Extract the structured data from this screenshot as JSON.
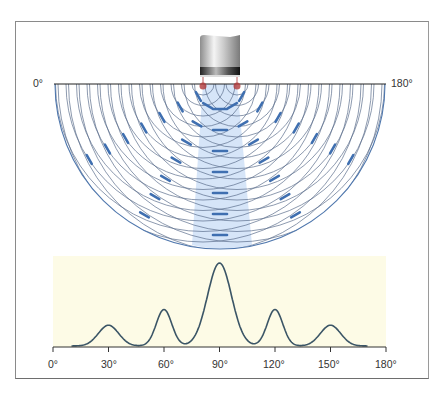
{
  "diagram": {
    "top_labels": {
      "left": "0°",
      "right": "180°"
    },
    "transducer": {
      "label": "ultrasound-transducer",
      "sources": 2
    },
    "colors": {
      "frame": "#8a8a8a",
      "wavefront": "#5b6f8c",
      "wavefront_highlight": "#3f6fb0",
      "beam_fill": "#cfe0f7",
      "source_dot": "#b23a3a",
      "chart_bg": "#fdfbe6",
      "curve": "#3b5566"
    }
  },
  "chart_data": {
    "type": "line",
    "title": "",
    "xlabel": "",
    "ylabel": "",
    "x_ticks": [
      "0°",
      "30°",
      "60°",
      "90°",
      "120°",
      "150°",
      "180°"
    ],
    "xlim": [
      0,
      180
    ],
    "grid": false,
    "legend": null,
    "peaks": [
      {
        "angle": 30,
        "relative_intensity": 0.25
      },
      {
        "angle": 60,
        "relative_intensity": 0.44
      },
      {
        "angle": 90,
        "relative_intensity": 1.0
      },
      {
        "angle": 120,
        "relative_intensity": 0.44
      },
      {
        "angle": 150,
        "relative_intensity": 0.25
      }
    ],
    "curve_range": [
      10,
      170
    ]
  }
}
